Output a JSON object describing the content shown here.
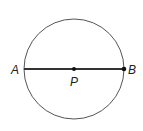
{
  "diagram": {
    "shape": "circle with diameter",
    "points": {
      "A": "A",
      "B": "B",
      "P": "P"
    },
    "line_color": "#333333",
    "circle_color": "#555555"
  }
}
